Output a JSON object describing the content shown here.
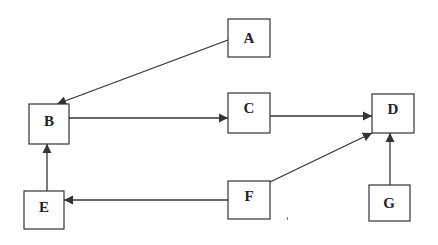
{
  "diagram": {
    "type": "directed-graph",
    "nodes": [
      {
        "id": "A",
        "label": "A",
        "x": 228,
        "y": 19,
        "w": 42,
        "h": 38
      },
      {
        "id": "B",
        "label": "B",
        "x": 29,
        "y": 104,
        "w": 40,
        "h": 40
      },
      {
        "id": "C",
        "label": "C",
        "x": 228,
        "y": 93,
        "w": 42,
        "h": 40
      },
      {
        "id": "D",
        "label": "D",
        "x": 372,
        "y": 94,
        "w": 42,
        "h": 39
      },
      {
        "id": "E",
        "label": "E",
        "x": 24,
        "y": 191,
        "w": 40,
        "h": 38
      },
      {
        "id": "F",
        "label": "F",
        "x": 228,
        "y": 181,
        "w": 42,
        "h": 38
      },
      {
        "id": "G",
        "label": "G",
        "x": 369,
        "y": 185,
        "w": 41,
        "h": 36
      }
    ],
    "edges": [
      {
        "from": "A",
        "to": "B"
      },
      {
        "from": "B",
        "to": "C"
      },
      {
        "from": "C",
        "to": "D"
      },
      {
        "from": "F",
        "to": "D"
      },
      {
        "from": "G",
        "to": "D"
      },
      {
        "from": "F",
        "to": "E"
      },
      {
        "from": "E",
        "to": "B"
      }
    ],
    "colors": {
      "stroke": "#333333",
      "background": "#ffffff",
      "text": "#222222"
    }
  }
}
